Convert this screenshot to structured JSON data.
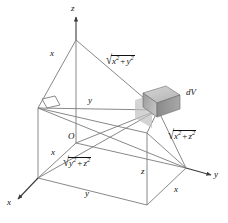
{
  "figure": {
    "background_color": "#ffffff",
    "line_color": "#6f6f6f",
    "axis_color": "#3a3a3a",
    "text_color": "#111111",
    "box_fill_top": "#c9c9c9",
    "box_fill_front": "#b0b0b0",
    "box_fill_side": "#8f8f8f",
    "box_shadow": "#bdbdbd"
  },
  "axes": [
    {
      "id": "z-axis",
      "label": "z",
      "direction": "up"
    },
    {
      "id": "y-axis",
      "label": "y",
      "direction": "right"
    },
    {
      "id": "x-axis",
      "label": "x",
      "direction": "lower-left"
    }
  ],
  "labels": {
    "origin": "O",
    "axis_z": "z",
    "axis_y": "y",
    "axis_x": "x",
    "edge_x_top": "x",
    "edge_y_mid": "y",
    "edge_x_left": "x",
    "edge_y_bottom": "y",
    "edge_z_bottom": "z",
    "edge_x_right": "x",
    "volume_element": "dV"
  },
  "expressions": [
    {
      "id": "dist-xy",
      "radicand_parts": [
        "x",
        "2",
        " + ",
        "y",
        "2"
      ],
      "plain": "sqrt(x^2 + y^2)"
    },
    {
      "id": "dist-xz",
      "radicand_parts": [
        "x",
        "2",
        " + ",
        "z",
        "2"
      ],
      "plain": "sqrt(x^2 + z^2)"
    },
    {
      "id": "dist-yz",
      "radicand_parts": [
        "y",
        "2",
        " + ",
        "z",
        "2"
      ],
      "plain": "sqrt(y^2 + z^2)"
    }
  ],
  "expr_text": {
    "dist_xy_var1": "x",
    "dist_xy_var2": "y",
    "dist_xz_var1": "x",
    "dist_xz_var2": "z",
    "dist_yz_var1": "y",
    "dist_yz_var2": "z",
    "exponent": "2",
    "plus": "+",
    "radical_sign": "√"
  },
  "markers": {
    "right_angle": "right-angle-marker"
  }
}
